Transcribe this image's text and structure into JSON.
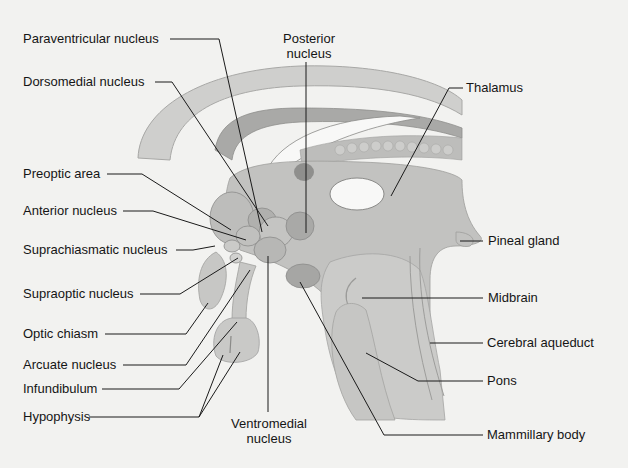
{
  "diagram": {
    "labels": {
      "paraventricular": "Paraventricular nucleus",
      "posterior_l1": "Posterior",
      "posterior_l2": "nucleus",
      "dorsomedial": "Dorsomedial nucleus",
      "thalamus": "Thalamus",
      "preoptic": "Preoptic area",
      "anterior": "Anterior nucleus",
      "suprachiasmatic": "Suprachiasmatic nucleus",
      "pineal": "Pineal gland",
      "supraoptic": "Supraoptic nucleus",
      "midbrain": "Midbrain",
      "optic_chiasm": "Optic chiasm",
      "cerebral_aqueduct": "Cerebral aqueduct",
      "arcuate": "Arcuate nucleus",
      "pons": "Pons",
      "infundibulum": "Infundibulum",
      "hypophysis": "Hypophysis",
      "ventromedial_l1": "Ventromedial",
      "ventromedial_l2": "nucleus",
      "mammillary": "Mammillary body"
    },
    "colors": {
      "background": "#f2f2f0",
      "tissue_light": "#c9c9c7",
      "tissue_mid": "#b4b4b2",
      "tissue_dark": "#9a9a98",
      "ventricle": "#f7f7f6",
      "leader_line": "#1a1a1a"
    }
  }
}
